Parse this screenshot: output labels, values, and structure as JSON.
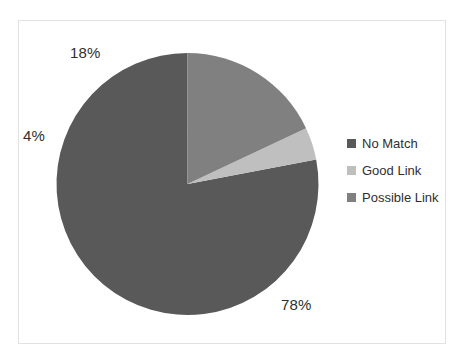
{
  "chart_data": {
    "type": "pie",
    "title": "",
    "subtitle": "",
    "xlabel": "",
    "ylabel": "",
    "grid": false,
    "legend_position": "right",
    "start_angle_deg": 90,
    "direction": "counterclockwise",
    "categories": [
      "No Match",
      "Good Link",
      "Possible Link"
    ],
    "values": [
      78,
      4,
      18
    ],
    "value_unit": "percent",
    "data_labels": [
      "78%",
      "4%",
      "18%"
    ],
    "colors": [
      "#595959",
      "#bfbfbf",
      "#808080"
    ],
    "slices": [
      {
        "label": "No Match",
        "value": 78,
        "display": "78%",
        "color": "#595959"
      },
      {
        "label": "Good Link",
        "value": 4,
        "display": "4%",
        "color": "#bfbfbf"
      },
      {
        "label": "Possible Link",
        "value": 18,
        "display": "18%",
        "color": "#808080"
      }
    ]
  },
  "labels": {
    "no_match_pct": "78%",
    "good_link_pct": "4%",
    "possible_link_pct": "18%"
  },
  "legend": {
    "items": [
      {
        "label": "No Match",
        "color": "#595959"
      },
      {
        "label": "Good Link",
        "color": "#bfbfbf"
      },
      {
        "label": "Possible Link",
        "color": "#808080"
      }
    ]
  },
  "style": {
    "background": "#ffffff",
    "frame_border": "#e2e2e2",
    "text_color": "#2f2f2f"
  }
}
